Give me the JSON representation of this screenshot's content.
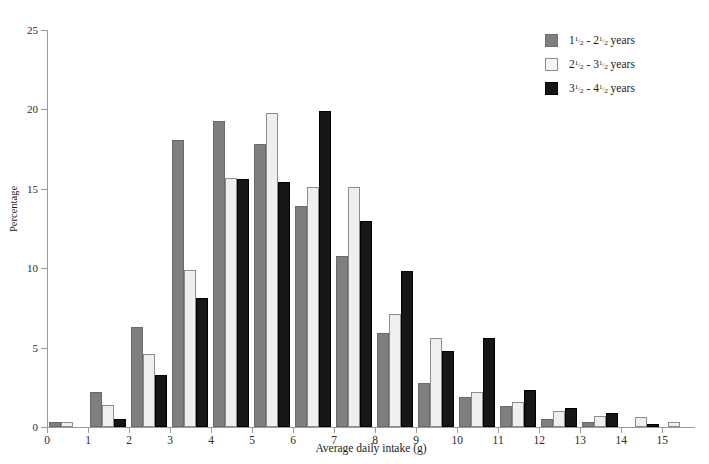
{
  "cut_caption": "",
  "axes": {
    "ylabel": "Percentage",
    "xlabel": "Average daily intake (g)",
    "yticks": [
      0,
      5,
      10,
      15,
      20,
      25
    ],
    "xticks": [
      0,
      1,
      2,
      3,
      4,
      5,
      6,
      7,
      8,
      9,
      10,
      11,
      12,
      13,
      14,
      15
    ]
  },
  "legend": {
    "position": "top-right",
    "items": [
      {
        "label": "1¹/₂ - 2¹/₂ years",
        "low": "1",
        "high": "2",
        "unit": "years",
        "color": "#7f7f7f"
      },
      {
        "label": "2¹/₂ - 3¹/₂ years",
        "low": "2",
        "high": "3",
        "unit": "years",
        "color": "#efefef"
      },
      {
        "label": "3¹/₂ - 4¹/₂ years",
        "low": "3",
        "high": "4",
        "unit": "years",
        "color": "#161616"
      }
    ]
  },
  "chart_data": {
    "type": "bar",
    "title": "",
    "xlabel": "Average daily intake (g)",
    "ylabel": "Percentage",
    "xlim": [
      0,
      15.8
    ],
    "ylim": [
      0,
      25
    ],
    "grid": false,
    "legend_position": "top-right",
    "categories": [
      0.5,
      1.5,
      2.5,
      3.5,
      4.5,
      5.5,
      6.5,
      7.5,
      8.5,
      9.5,
      10.5,
      11.5,
      12.5,
      13.5,
      14.5,
      15.3
    ],
    "series": [
      {
        "name": "1¹/₂ - 2¹/₂ years",
        "color": "#7f7f7f",
        "values": [
          0.3,
          2.2,
          6.3,
          18.1,
          19.3,
          17.8,
          13.9,
          10.8,
          5.9,
          2.8,
          1.9,
          1.3,
          0.5,
          0.3,
          0.0,
          0.0
        ]
      },
      {
        "name": "2¹/₂ - 3¹/₂ years",
        "color": "#efefef",
        "values": [
          0.3,
          1.4,
          4.6,
          9.9,
          15.7,
          19.8,
          15.1,
          15.1,
          7.1,
          5.6,
          2.2,
          1.6,
          1.0,
          0.7,
          0.6,
          0.3
        ]
      },
      {
        "name": "3¹/₂ - 4¹/₂ years",
        "color": "#161616",
        "values": [
          0.0,
          0.5,
          3.3,
          8.1,
          15.6,
          15.4,
          19.9,
          13.0,
          9.8,
          4.8,
          5.6,
          2.3,
          1.2,
          0.9,
          0.2,
          0.0
        ]
      }
    ]
  }
}
